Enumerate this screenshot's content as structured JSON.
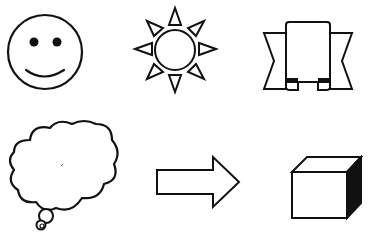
{
  "figure": {
    "background": "#ffffff",
    "stroke_color": "#111111",
    "shapes": [
      {
        "id": "smiley-face",
        "label": "Smiley face"
      },
      {
        "id": "sun",
        "label": "Sun"
      },
      {
        "id": "ribbon-banner",
        "label": "Ribbon banner"
      },
      {
        "id": "thought-cloud",
        "label": "Thought bubble cloud"
      },
      {
        "id": "right-arrow",
        "label": "Block arrow pointing right"
      },
      {
        "id": "cube",
        "label": "Cube"
      }
    ]
  }
}
